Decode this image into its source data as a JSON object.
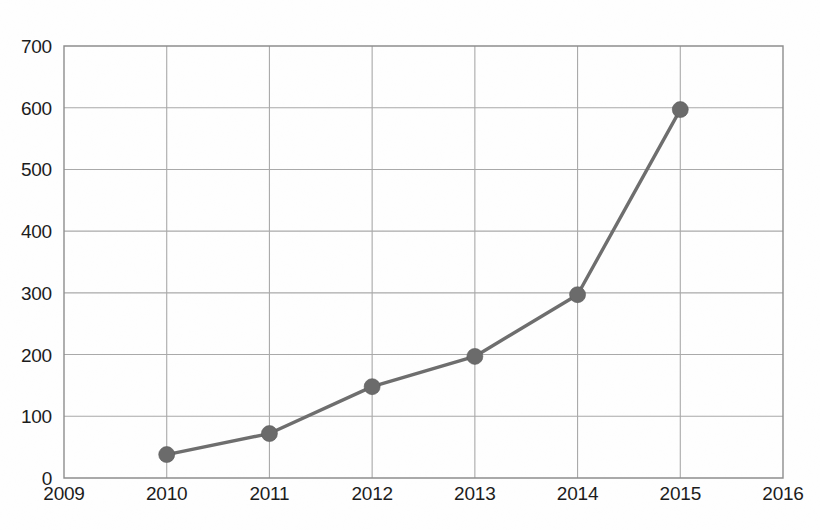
{
  "chart_data": {
    "type": "line",
    "title": "",
    "subtitle": "",
    "xlabel": "",
    "ylabel": "",
    "x": [
      2010,
      2011,
      2012,
      2013,
      2014,
      2015
    ],
    "values": [
      38,
      72,
      148,
      197,
      297,
      597
    ],
    "series": [
      {
        "name": "series-1",
        "x": [
          2010,
          2011,
          2012,
          2013,
          2014,
          2015
        ],
        "values": [
          38,
          72,
          148,
          197,
          297,
          597
        ]
      }
    ],
    "xlim": [
      2009,
      2016
    ],
    "ylim": [
      0,
      700
    ],
    "x_tick_labels": [
      "2009",
      "2010",
      "2011",
      "2012",
      "2013",
      "2014",
      "2015",
      "2016"
    ],
    "x_ticks": [
      2009,
      2010,
      2011,
      2012,
      2013,
      2014,
      2015,
      2016
    ],
    "y_tick_labels": [
      "0",
      "100",
      "200",
      "300",
      "400",
      "500",
      "600",
      "700"
    ],
    "y_ticks": [
      0,
      100,
      200,
      300,
      400,
      500,
      600,
      700
    ],
    "grid": {
      "horizontal": true,
      "vertical": true,
      "color": "#a9a9a9"
    },
    "legend": {
      "visible": false,
      "position": "none",
      "entries": []
    },
    "annotations": [],
    "colors": {
      "line": "#6e6e6e",
      "marker": "#6b6b6b",
      "axis": "#8d8d8d",
      "grid": "#a9a9a9",
      "text": "#1c1c1c",
      "background": "#fefefe"
    },
    "marker": {
      "shape": "circle",
      "radius_px": 8
    }
  },
  "geometry": {
    "plot_left": 64,
    "plot_right": 783,
    "plot_top": 46,
    "plot_bottom": 478,
    "x_label_y": 500,
    "y_label_dx": -12
  }
}
